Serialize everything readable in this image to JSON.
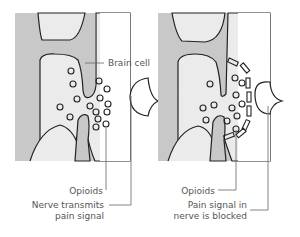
{
  "panels": [
    {
      "id": "left",
      "title": "Normal pain transmission",
      "labels": {
        "brain_cell": "Brain cell",
        "opioids": "Opioids",
        "nerve_line1": "Nerve transmits",
        "nerve_line2": "pain signal"
      }
    },
    {
      "id": "right",
      "title": "Opioid receptor binding",
      "labels": {
        "opioids": "Opioids",
        "blocked_line1": "Pain signal in",
        "blocked_line2": "nerve is blocked"
      }
    }
  ],
  "colors": {
    "cell_fill": "#c8c8c8",
    "background_fill": "#e8e8e8",
    "outline": "#222222",
    "leader": "#666666"
  }
}
